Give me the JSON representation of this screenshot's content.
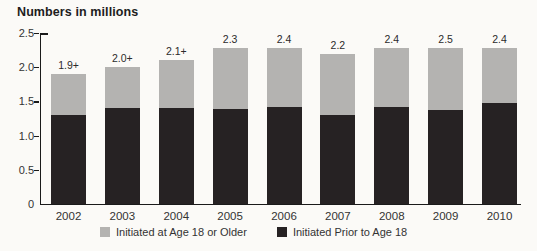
{
  "title": "Numbers in millions",
  "colors": {
    "background": "#fbfaf7",
    "axis": "#1a1a1a",
    "dark_series": "#262223",
    "gray_series": "#b4b3b1",
    "text": "#333333"
  },
  "chart_data": {
    "type": "bar",
    "stacked": true,
    "title": "Numbers in millions",
    "categories": [
      "2002",
      "2003",
      "2004",
      "2005",
      "2006",
      "2007",
      "2008",
      "2009",
      "2010"
    ],
    "series": [
      {
        "name": "Initiated Prior to Age 18",
        "color": "#262223",
        "values": [
          1.3,
          1.4,
          1.4,
          1.4,
          1.5,
          1.3,
          1.5,
          1.5,
          1.55
        ]
      },
      {
        "name": "Initiated at Age 18 or Older",
        "color": "#b4b3b1",
        "values": [
          0.6,
          0.6,
          0.7,
          0.9,
          0.9,
          0.9,
          0.9,
          1.0,
          0.85
        ]
      }
    ],
    "total_labels": [
      "1.9+",
      "2.0+",
      "2.1+",
      "2.3",
      "2.4",
      "2.2",
      "2.4",
      "2.5",
      "2.4"
    ],
    "ytick_labels": [
      "2.5",
      "2.0",
      "1.5",
      "1.0",
      "0.5",
      "0"
    ],
    "ylim": [
      0,
      2.5
    ],
    "grid": false,
    "legend_position": "bottom",
    "legend": [
      {
        "label": "Initiated at Age 18 or Older",
        "color": "#b4b3b1"
      },
      {
        "label": "Initiated Prior to Age 18",
        "color": "#262223"
      }
    ]
  }
}
